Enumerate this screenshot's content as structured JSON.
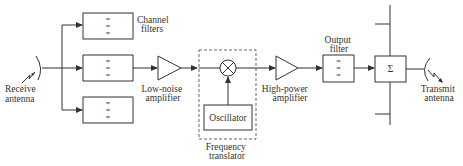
{
  "diagram": {
    "colors": {
      "line": "#333333",
      "background": "#ffffff"
    },
    "labels": {
      "receive_antenna": [
        "Receive",
        "antenna"
      ],
      "channel_filters": [
        "Channel",
        "filters"
      ],
      "low_noise_amplifier": [
        "Low-noise",
        "amplifier"
      ],
      "oscillator": "Oscillator",
      "frequency_translator": [
        "Frequency",
        "translator"
      ],
      "high_power_amplifier": [
        "High-power",
        "amplifier"
      ],
      "output_filter": [
        "Output",
        "filter"
      ],
      "summer": "Σ",
      "transmit_antenna": [
        "Transmit",
        "antenna"
      ]
    },
    "filter_glyph": [
      "≈",
      "≈",
      "≈"
    ],
    "blocks": [
      {
        "id": "receive-antenna",
        "type": "antenna"
      },
      {
        "id": "channel-filter-1",
        "type": "bandpass-filter"
      },
      {
        "id": "channel-filter-2",
        "type": "bandpass-filter"
      },
      {
        "id": "channel-filter-3",
        "type": "bandpass-filter"
      },
      {
        "id": "low-noise-amplifier",
        "type": "amplifier"
      },
      {
        "id": "mixer",
        "type": "mixer"
      },
      {
        "id": "oscillator",
        "type": "oscillator"
      },
      {
        "id": "high-power-amplifier",
        "type": "amplifier"
      },
      {
        "id": "output-filter",
        "type": "bandpass-filter"
      },
      {
        "id": "summer",
        "type": "summing-junction"
      },
      {
        "id": "transmit-antenna",
        "type": "antenna"
      }
    ],
    "connections": [
      [
        "receive-antenna",
        "channel-filter-1"
      ],
      [
        "receive-antenna",
        "channel-filter-2"
      ],
      [
        "receive-antenna",
        "channel-filter-3"
      ],
      [
        "channel-filter-2",
        "low-noise-amplifier"
      ],
      [
        "low-noise-amplifier",
        "mixer"
      ],
      [
        "oscillator",
        "mixer"
      ],
      [
        "mixer",
        "high-power-amplifier"
      ],
      [
        "high-power-amplifier",
        "output-filter"
      ],
      [
        "output-filter",
        "summer"
      ],
      [
        "summer",
        "transmit-antenna"
      ]
    ]
  }
}
